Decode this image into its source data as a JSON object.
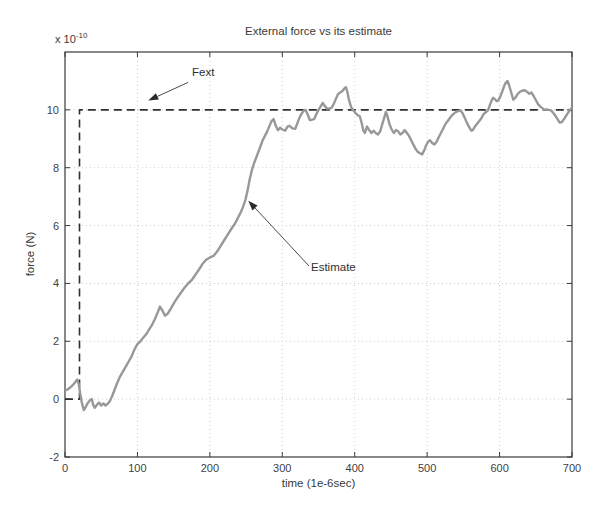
{
  "figure": {
    "title": "External force vs its estimate",
    "xlabel": "time (1e-6sec)",
    "ylabel": "force (N)",
    "y_scale": {
      "base": "x 10",
      "exp": "-10"
    }
  },
  "colors": {
    "background": "#ffffff",
    "axis": "#3a3a3a",
    "tick_text": "#3f3f3f",
    "grid": "#cccccc",
    "fext_line": "#303030",
    "estimate_line": "#989898",
    "annotation_arrow": "#4a4a4a"
  },
  "chart_data": {
    "type": "line",
    "title": "External force vs its estimate",
    "xlabel": "time (1e-6sec)",
    "ylabel": "force (N)",
    "y_multiplier_label": "x 10^-10",
    "xlim": [
      0,
      700
    ],
    "ylim": [
      -2,
      12
    ],
    "xticks": [
      0,
      100,
      200,
      300,
      400,
      500,
      600,
      700
    ],
    "yticks": [
      -2,
      0,
      2,
      4,
      6,
      8,
      10
    ],
    "grid": "dotted",
    "legend": "none",
    "series": [
      {
        "name": "Fext",
        "style": "dashed",
        "color": "#303030",
        "width": 1.6,
        "points": [
          [
            0,
            0
          ],
          [
            20,
            0
          ],
          [
            20,
            10
          ],
          [
            700,
            10
          ]
        ]
      },
      {
        "name": "Estimate",
        "style": "solid",
        "color": "#989898",
        "width": 2.4,
        "points": [
          [
            0,
            0.3
          ],
          [
            4,
            0.34
          ],
          [
            8,
            0.42
          ],
          [
            12,
            0.52
          ],
          [
            15,
            0.62
          ],
          [
            17,
            0.68
          ],
          [
            19,
            0.52
          ],
          [
            21,
            0.2
          ],
          [
            23,
            -0.1
          ],
          [
            26,
            -0.38
          ],
          [
            28,
            -0.3
          ],
          [
            31,
            -0.15
          ],
          [
            34,
            -0.05
          ],
          [
            37,
            0.0
          ],
          [
            39,
            -0.2
          ],
          [
            41,
            -0.3
          ],
          [
            44,
            -0.2
          ],
          [
            47,
            -0.12
          ],
          [
            50,
            -0.22
          ],
          [
            53,
            -0.15
          ],
          [
            56,
            -0.22
          ],
          [
            59,
            -0.16
          ],
          [
            62,
            -0.06
          ],
          [
            65,
            0.1
          ],
          [
            68,
            0.3
          ],
          [
            72,
            0.55
          ],
          [
            76,
            0.78
          ],
          [
            80,
            0.95
          ],
          [
            84,
            1.12
          ],
          [
            88,
            1.3
          ],
          [
            92,
            1.48
          ],
          [
            96,
            1.72
          ],
          [
            100,
            1.9
          ],
          [
            104,
            2.0
          ],
          [
            108,
            2.12
          ],
          [
            112,
            2.24
          ],
          [
            116,
            2.4
          ],
          [
            120,
            2.56
          ],
          [
            124,
            2.76
          ],
          [
            128,
            3.0
          ],
          [
            131,
            3.2
          ],
          [
            134,
            3.08
          ],
          [
            138,
            2.88
          ],
          [
            142,
            2.96
          ],
          [
            146,
            3.12
          ],
          [
            150,
            3.3
          ],
          [
            155,
            3.5
          ],
          [
            160,
            3.68
          ],
          [
            165,
            3.85
          ],
          [
            170,
            4.0
          ],
          [
            175,
            4.12
          ],
          [
            180,
            4.3
          ],
          [
            185,
            4.48
          ],
          [
            190,
            4.68
          ],
          [
            195,
            4.82
          ],
          [
            200,
            4.9
          ],
          [
            205,
            4.95
          ],
          [
            210,
            5.1
          ],
          [
            215,
            5.3
          ],
          [
            220,
            5.5
          ],
          [
            225,
            5.7
          ],
          [
            230,
            5.9
          ],
          [
            235,
            6.08
          ],
          [
            239,
            6.28
          ],
          [
            243,
            6.48
          ],
          [
            246,
            6.66
          ],
          [
            249,
            6.88
          ],
          [
            252,
            7.2
          ],
          [
            255,
            7.6
          ],
          [
            258,
            7.92
          ],
          [
            261,
            8.15
          ],
          [
            264,
            8.35
          ],
          [
            267,
            8.55
          ],
          [
            270,
            8.75
          ],
          [
            273,
            8.95
          ],
          [
            276,
            9.1
          ],
          [
            279,
            9.25
          ],
          [
            282,
            9.42
          ],
          [
            285,
            9.6
          ],
          [
            288,
            9.68
          ],
          [
            291,
            9.45
          ],
          [
            294,
            9.3
          ],
          [
            297,
            9.38
          ],
          [
            300,
            9.32
          ],
          [
            304,
            9.28
          ],
          [
            307,
            9.42
          ],
          [
            310,
            9.45
          ],
          [
            314,
            9.36
          ],
          [
            318,
            9.35
          ],
          [
            321,
            9.55
          ],
          [
            324,
            9.75
          ],
          [
            327,
            9.88
          ],
          [
            330,
            9.98
          ],
          [
            332,
            10.0
          ],
          [
            335,
            9.85
          ],
          [
            338,
            9.65
          ],
          [
            341,
            9.66
          ],
          [
            344,
            9.68
          ],
          [
            347,
            9.85
          ],
          [
            350,
            10.0
          ],
          [
            353,
            10.12
          ],
          [
            356,
            10.24
          ],
          [
            359,
            10.12
          ],
          [
            362,
            10.04
          ],
          [
            365,
            10.05
          ],
          [
            368,
            10.07
          ],
          [
            371,
            10.2
          ],
          [
            374,
            10.38
          ],
          [
            377,
            10.55
          ],
          [
            380,
            10.6
          ],
          [
            383,
            10.65
          ],
          [
            386,
            10.75
          ],
          [
            388,
            10.78
          ],
          [
            390,
            10.6
          ],
          [
            392,
            10.35
          ],
          [
            395,
            10.1
          ],
          [
            398,
            9.98
          ],
          [
            401,
            9.9
          ],
          [
            404,
            9.82
          ],
          [
            407,
            9.78
          ],
          [
            410,
            9.5
          ],
          [
            412,
            9.28
          ],
          [
            414,
            9.2
          ],
          [
            417,
            9.42
          ],
          [
            420,
            9.3
          ],
          [
            423,
            9.2
          ],
          [
            426,
            9.28
          ],
          [
            429,
            9.2
          ],
          [
            432,
            9.15
          ],
          [
            435,
            9.25
          ],
          [
            438,
            9.5
          ],
          [
            441,
            9.75
          ],
          [
            443,
            9.93
          ],
          [
            445,
            9.8
          ],
          [
            448,
            9.5
          ],
          [
            451,
            9.32
          ],
          [
            454,
            9.2
          ],
          [
            457,
            9.3
          ],
          [
            460,
            9.26
          ],
          [
            463,
            9.15
          ],
          [
            466,
            9.2
          ],
          [
            469,
            9.3
          ],
          [
            472,
            9.2
          ],
          [
            475,
            9.1
          ],
          [
            478,
            8.95
          ],
          [
            481,
            8.8
          ],
          [
            484,
            8.65
          ],
          [
            487,
            8.55
          ],
          [
            490,
            8.5
          ],
          [
            493,
            8.46
          ],
          [
            496,
            8.6
          ],
          [
            499,
            8.8
          ],
          [
            502,
            8.92
          ],
          [
            504,
            8.95
          ],
          [
            507,
            8.85
          ],
          [
            510,
            8.8
          ],
          [
            513,
            8.9
          ],
          [
            516,
            9.05
          ],
          [
            519,
            9.2
          ],
          [
            522,
            9.35
          ],
          [
            525,
            9.5
          ],
          [
            528,
            9.6
          ],
          [
            531,
            9.7
          ],
          [
            534,
            9.8
          ],
          [
            538,
            9.9
          ],
          [
            542,
            9.95
          ],
          [
            546,
            9.98
          ],
          [
            549,
            9.88
          ],
          [
            552,
            9.72
          ],
          [
            555,
            9.55
          ],
          [
            558,
            9.4
          ],
          [
            561,
            9.28
          ],
          [
            563,
            9.3
          ],
          [
            566,
            9.42
          ],
          [
            569,
            9.52
          ],
          [
            572,
            9.62
          ],
          [
            575,
            9.72
          ],
          [
            578,
            9.85
          ],
          [
            581,
            9.92
          ],
          [
            584,
            9.98
          ],
          [
            587,
            10.2
          ],
          [
            589,
            10.32
          ],
          [
            591,
            10.42
          ],
          [
            594,
            10.36
          ],
          [
            596,
            10.3
          ],
          [
            598,
            10.32
          ],
          [
            601,
            10.46
          ],
          [
            604,
            10.66
          ],
          [
            607,
            10.86
          ],
          [
            609,
            10.96
          ],
          [
            611,
            11.0
          ],
          [
            613,
            10.86
          ],
          [
            616,
            10.6
          ],
          [
            619,
            10.35
          ],
          [
            622,
            10.42
          ],
          [
            625,
            10.55
          ],
          [
            628,
            10.62
          ],
          [
            631,
            10.66
          ],
          [
            635,
            10.68
          ],
          [
            638,
            10.62
          ],
          [
            641,
            10.56
          ],
          [
            644,
            10.6
          ],
          [
            647,
            10.48
          ],
          [
            650,
            10.34
          ],
          [
            653,
            10.2
          ],
          [
            656,
            10.12
          ],
          [
            659,
            10.06
          ],
          [
            662,
            10.0
          ],
          [
            665,
            10.02
          ],
          [
            668,
            10.0
          ],
          [
            671,
            9.98
          ],
          [
            674,
            9.9
          ],
          [
            677,
            9.8
          ],
          [
            680,
            9.68
          ],
          [
            683,
            9.56
          ],
          [
            686,
            9.58
          ],
          [
            689,
            9.68
          ],
          [
            692,
            9.8
          ],
          [
            695,
            9.92
          ],
          [
            698,
            10.02
          ],
          [
            700,
            10.08
          ]
        ]
      }
    ],
    "annotations": [
      {
        "text": "Fext",
        "text_xy": [
          176,
          11.15
        ],
        "arrow_from": [
          170,
          10.95
        ],
        "arrow_to": [
          115,
          10.32
        ]
      },
      {
        "text": "Estimate",
        "text_xy": [
          341,
          4.45
        ],
        "arrow_from": [
          337,
          4.6
        ],
        "arrow_to": [
          253,
          6.86
        ]
      }
    ]
  }
}
